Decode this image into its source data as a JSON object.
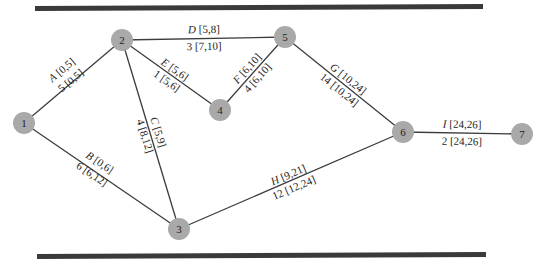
{
  "diagram": {
    "type": "activity-on-arrow network",
    "nodes": [
      {
        "id": "1",
        "x": 24,
        "y": 123
      },
      {
        "id": "2",
        "x": 122,
        "y": 40
      },
      {
        "id": "3",
        "x": 179,
        "y": 229
      },
      {
        "id": "4",
        "x": 220,
        "y": 110
      },
      {
        "id": "5",
        "x": 285,
        "y": 37
      },
      {
        "id": "6",
        "x": 403,
        "y": 132
      },
      {
        "id": "7",
        "x": 522,
        "y": 134
      }
    ],
    "edges": [
      {
        "from": "1",
        "to": "2",
        "activity": "A",
        "top_interval": "[0,5]",
        "duration": "5",
        "bottom_interval": "[0,5]"
      },
      {
        "from": "1",
        "to": "3",
        "activity": "B",
        "top_interval": "[0,6]",
        "duration": "6",
        "bottom_interval": "[6,12]"
      },
      {
        "from": "2",
        "to": "3",
        "activity": "C",
        "top_interval": "[5,9]",
        "duration": "4",
        "bottom_interval": "[8,12]"
      },
      {
        "from": "2",
        "to": "5",
        "activity": "D",
        "top_interval": "[5,8]",
        "duration": "3",
        "bottom_interval": "[7,10]"
      },
      {
        "from": "2",
        "to": "4",
        "activity": "E",
        "top_interval": "[5,6]",
        "duration": "1",
        "bottom_interval": "[5,6]"
      },
      {
        "from": "4",
        "to": "5",
        "activity": "F",
        "top_interval": "[6,10]",
        "duration": "4",
        "bottom_interval": "[6,10]"
      },
      {
        "from": "5",
        "to": "6",
        "activity": "G",
        "top_interval": "[10,24]",
        "duration": "14",
        "bottom_interval": "[10,24]"
      },
      {
        "from": "3",
        "to": "6",
        "activity": "H",
        "top_interval": "[9,21]",
        "duration": "12",
        "bottom_interval": "[12,24]"
      },
      {
        "from": "6",
        "to": "7",
        "activity": "I",
        "top_interval": "[24,26]",
        "duration": "2",
        "bottom_interval": "[24,26]"
      }
    ],
    "labels": {
      "A": {
        "top": " [0,5]",
        "bottom": "5 [0,5]"
      },
      "B": {
        "top": " [0,6]",
        "bottom": "6 [6,12]"
      },
      "C": {
        "top": " [5,9]",
        "bottom": "4 [8,12]"
      },
      "D": {
        "top": " [5,8]",
        "bottom": "3 [7,10]"
      },
      "E": {
        "top": " [5,6]",
        "bottom": "1 [5,6]"
      },
      "F": {
        "top": " [6,10]",
        "bottom": "4 [6,10]"
      },
      "G": {
        "top": " [10,24]",
        "bottom": "14 [10,24]"
      },
      "H": {
        "top": " [9,21]",
        "bottom": "12 [12,24]"
      },
      "I": {
        "top": " [24,26]",
        "bottom": "2 [24,26]"
      }
    },
    "colors": {
      "node_fill": "#a9a9a9",
      "edge": "#3c3c3c",
      "rule_bar": "#3a3a3a",
      "text": "#1e1e1e"
    }
  }
}
